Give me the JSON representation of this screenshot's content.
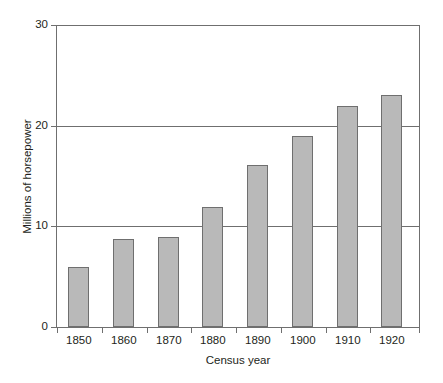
{
  "chart_data": {
    "type": "bar",
    "title": "",
    "xlabel": "Census year",
    "ylabel": "Millions of horsepower",
    "categories": [
      "1850",
      "1860",
      "1870",
      "1880",
      "1890",
      "1900",
      "1910",
      "1920"
    ],
    "values": [
      6,
      8.7,
      8.9,
      11.9,
      16.1,
      19,
      22,
      23
    ],
    "ylim": [
      0,
      30
    ],
    "yticks": [
      0,
      10,
      20,
      30
    ],
    "ytick_labels": [
      "0",
      "10",
      "20",
      "30"
    ],
    "grid": "horizontal",
    "legend": "none",
    "series": [
      {
        "name": "Millions of horsepower",
        "values": [
          6,
          8.7,
          8.9,
          11.9,
          16.1,
          19,
          22,
          23
        ]
      }
    ],
    "colors": {
      "bar_fill": "#b9b9b9",
      "bar_border": "#6f6f6f",
      "axis": "#6f6f6f",
      "text": "#231f20",
      "background": "#ffffff"
    }
  }
}
